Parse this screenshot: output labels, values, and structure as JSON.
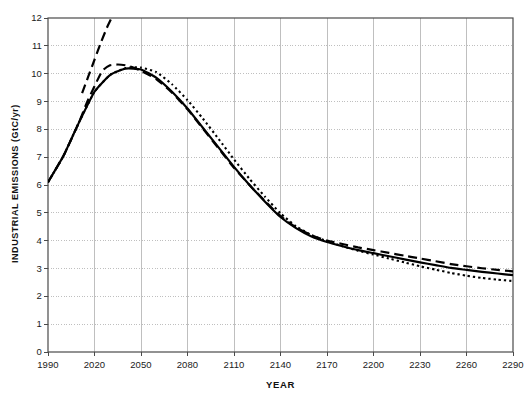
{
  "chart_data": {
    "type": "line",
    "title": "",
    "xlabel": "YEAR",
    "ylabel": "INDUSTRIAL EMISSIONS  (GtC/yr)",
    "xlim": [
      1990,
      2290
    ],
    "ylim": [
      0,
      12
    ],
    "xticks": [
      1990,
      2020,
      2050,
      2080,
      2110,
      2140,
      2170,
      2200,
      2230,
      2260,
      2290
    ],
    "yticks": [
      0,
      1,
      2,
      3,
      4,
      5,
      6,
      7,
      8,
      9,
      10,
      11,
      12
    ],
    "xtick_labels": [
      "1990",
      "2020",
      "2050",
      "2080",
      "2110",
      "2140",
      "2170",
      "2200",
      "2230",
      "2260",
      "2290"
    ],
    "ytick_labels": [
      "0",
      "1",
      "2",
      "3",
      "4",
      "5",
      "6",
      "7",
      "8",
      "9",
      "10",
      "11",
      "12"
    ],
    "grid": {
      "horizontal": "dotted",
      "vertical": "solid",
      "color": "#b8b8b8"
    },
    "legend": "none",
    "line_color": "#000000",
    "series": [
      {
        "name": "solid",
        "style": "solid",
        "x": [
          1990,
          2000,
          2010,
          2020,
          2030,
          2040,
          2050,
          2060,
          2070,
          2080,
          2090,
          2100,
          2110,
          2120,
          2130,
          2140,
          2150,
          2160,
          2170,
          2180,
          2190,
          2200,
          2210,
          2220,
          2230,
          2240,
          2250,
          2260,
          2270,
          2280,
          2290
        ],
        "values": [
          6.1,
          7.05,
          8.25,
          9.35,
          9.95,
          10.18,
          10.15,
          9.85,
          9.35,
          8.75,
          8.05,
          7.35,
          6.65,
          6.0,
          5.4,
          4.85,
          4.45,
          4.15,
          3.95,
          3.8,
          3.66,
          3.55,
          3.44,
          3.33,
          3.22,
          3.12,
          3.02,
          2.95,
          2.88,
          2.82,
          2.76
        ]
      },
      {
        "name": "dashed",
        "style": "dashed",
        "x": [
          1990,
          2000,
          2010,
          2015,
          2020,
          2025,
          2030,
          2035,
          2040,
          2045,
          2050,
          2060,
          2070,
          2080,
          2090,
          2100,
          2110,
          2120,
          2130,
          2140,
          2150,
          2160,
          2170,
          2180,
          2190,
          2200,
          2210,
          2220,
          2230,
          2240,
          2250,
          2260,
          2270,
          2280,
          2290
        ],
        "values": [
          6.1,
          7.05,
          8.25,
          8.95,
          9.55,
          10.1,
          10.3,
          10.33,
          10.3,
          10.22,
          10.1,
          9.8,
          9.32,
          8.72,
          8.02,
          7.32,
          6.62,
          6.0,
          5.42,
          4.88,
          4.48,
          4.2,
          4.0,
          3.88,
          3.76,
          3.66,
          3.56,
          3.46,
          3.36,
          3.26,
          3.16,
          3.08,
          3.01,
          2.95,
          2.9
        ]
      },
      {
        "name": "dashed-steep",
        "style": "dashed",
        "note": "steep branch rising off the top of the plot",
        "x": [
          2012,
          2016,
          2020,
          2024,
          2028,
          2031
        ],
        "values": [
          9.3,
          9.9,
          10.5,
          11.1,
          11.65,
          12.0
        ]
      },
      {
        "name": "dotted",
        "style": "dotted",
        "x": [
          1990,
          2000,
          2010,
          2020,
          2030,
          2040,
          2050,
          2060,
          2070,
          2080,
          2090,
          2100,
          2110,
          2120,
          2130,
          2140,
          2150,
          2160,
          2170,
          2180,
          2190,
          2200,
          2210,
          2220,
          2230,
          2240,
          2250,
          2260,
          2270,
          2280,
          2290
        ],
        "values": [
          6.1,
          7.05,
          8.25,
          9.35,
          9.95,
          10.2,
          10.22,
          10.05,
          9.62,
          9.05,
          8.38,
          7.66,
          6.92,
          6.22,
          5.58,
          4.98,
          4.52,
          4.2,
          3.98,
          3.8,
          3.64,
          3.5,
          3.36,
          3.22,
          3.08,
          2.96,
          2.84,
          2.74,
          2.66,
          2.6,
          2.55
        ]
      }
    ]
  }
}
